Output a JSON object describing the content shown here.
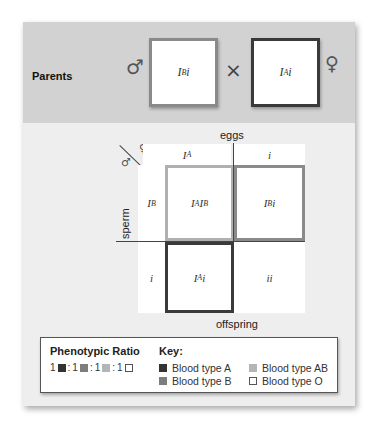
{
  "parents": {
    "label": "Parents",
    "male_symbol": "♂",
    "female_symbol": "♀",
    "cross_symbol": "×",
    "father": {
      "allele_base": "I",
      "allele_sup": "B",
      "allele_rest": "i",
      "phenotype": "Blood type B"
    },
    "mother": {
      "allele_base": "I",
      "allele_sup": "A",
      "allele_rest": "i",
      "phenotype": "Blood type A"
    }
  },
  "punnett": {
    "eggs_label": "eggs",
    "sperm_label": "sperm",
    "offspring_label": "offspring",
    "corner_male": "♂",
    "corner_female": "♀",
    "columns": [
      {
        "base": "I",
        "sup": "A",
        "rest": ""
      },
      {
        "base": "i",
        "sup": "",
        "rest": ""
      }
    ],
    "rows": [
      {
        "base": "I",
        "sup": "B",
        "rest": ""
      },
      {
        "base": "i",
        "sup": "",
        "rest": ""
      }
    ],
    "cells": [
      {
        "p1": "I",
        "s1": "A",
        "p2": "I",
        "s2": "B",
        "p3": "",
        "phenotype": "AB"
      },
      {
        "p1": "I",
        "s1": "B",
        "p2": "i",
        "s2": "",
        "p3": "",
        "phenotype": "B"
      },
      {
        "p1": "I",
        "s1": "A",
        "p2": "i",
        "s2": "",
        "p3": "",
        "phenotype": "A"
      },
      {
        "p1": "ii",
        "s1": "",
        "p2": "",
        "s2": "",
        "p3": "",
        "phenotype": "O"
      }
    ]
  },
  "legend": {
    "ratio_title": "Phenotypic Ratio",
    "ratio_parts": [
      "1",
      ":",
      "1",
      ":",
      "1",
      ":",
      "1"
    ],
    "key_title": "Key:",
    "key_items": [
      {
        "label": "Blood type A",
        "color": "#333333"
      },
      {
        "label": "Blood type AB",
        "color": "#b5b5b5"
      },
      {
        "label": "Blood type B",
        "color": "#7d7d7d"
      },
      {
        "label": "Blood type O",
        "color": "#ffffff"
      }
    ]
  },
  "colors": {
    "type_a": "#333333",
    "type_b": "#7d7d7d",
    "type_ab": "#b5b5b5",
    "type_o": "#ffffff",
    "top_band": "#d2d2d2",
    "panel": "#eeeeee"
  }
}
